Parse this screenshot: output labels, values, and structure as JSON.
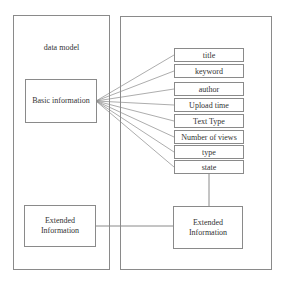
{
  "left_panel": {
    "title": "data model",
    "basic_box": "Basic information",
    "extended_box_line1": "Extended",
    "extended_box_line2": "Information"
  },
  "right_panel": {
    "attributes": [
      "title",
      "keyword",
      "author",
      "Upload time",
      "Text Type",
      "Number of views",
      "type",
      "state"
    ],
    "extended_box_line1": "Extended",
    "extended_box_line2": "Information"
  },
  "colors": {
    "line": "#8a8a8a",
    "text": "#333333"
  }
}
